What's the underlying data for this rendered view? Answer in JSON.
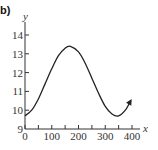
{
  "panel_label": "b)",
  "chart_data": {
    "type": "line",
    "title": "",
    "xlabel": "x",
    "ylabel": "y",
    "xlim": [
      0,
      400
    ],
    "ylim": [
      9,
      14
    ],
    "x_ticks": [
      0,
      100,
      200,
      300,
      400
    ],
    "x_minor_ticks": [
      50,
      150,
      250,
      350
    ],
    "y_ticks": [
      9,
      10,
      11,
      12,
      13,
      14
    ],
    "x_tick_labels": [
      "0",
      "100",
      "200",
      "300",
      "400"
    ],
    "y_tick_labels": [
      "9",
      "10",
      "11",
      "12",
      "13",
      "14"
    ],
    "grid": false,
    "legend": null,
    "series": [
      {
        "name": "curve",
        "description": "sinusoidal curve with arrow at right end",
        "x": [
          0,
          25,
          50,
          75,
          100,
          125,
          150,
          170,
          200,
          225,
          250,
          275,
          300,
          325,
          350,
          375,
          395
        ],
        "y": [
          9.7,
          10.0,
          10.6,
          11.4,
          12.2,
          12.9,
          13.3,
          13.4,
          13.1,
          12.5,
          11.7,
          10.9,
          10.2,
          9.8,
          9.7,
          10.0,
          10.5
        ]
      }
    ]
  }
}
